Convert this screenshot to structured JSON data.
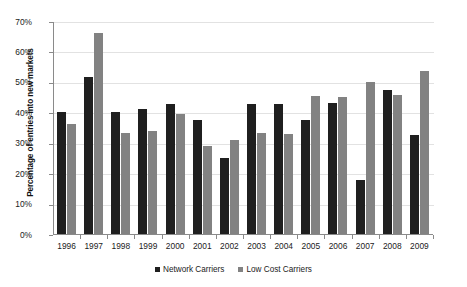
{
  "chart_data": {
    "type": "bar",
    "title": "",
    "xlabel": "",
    "ylabel": "Percentage of entries into new markets",
    "ylim": [
      0,
      70
    ],
    "ytick_labels": [
      "70%",
      "60%",
      "50%",
      "40%",
      "30%",
      "20%",
      "10%",
      "0%"
    ],
    "ytick_values": [
      70,
      60,
      50,
      40,
      30,
      20,
      10,
      0
    ],
    "grid": true,
    "legend_position": "bottom",
    "categories": [
      "1996",
      "1997",
      "1998",
      "1999",
      "2000",
      "2001",
      "2002",
      "2003",
      "2004",
      "2005",
      "2006",
      "2007",
      "2008",
      "2009"
    ],
    "series": [
      {
        "name": "Network Carriers",
        "color": "#1f1f1f",
        "values": [
          40.2,
          51.7,
          40.2,
          41.0,
          42.7,
          37.6,
          24.9,
          42.7,
          42.7,
          37.6,
          43.1,
          17.9,
          47.3,
          32.4
        ]
      },
      {
        "name": "Low Cost Carriers",
        "color": "#828282",
        "values": [
          36.3,
          65.9,
          33.2,
          33.9,
          39.6,
          28.9,
          30.8,
          33.3,
          32.9,
          45.4,
          44.9,
          49.9,
          45.7,
          53.5
        ]
      }
    ]
  },
  "legend": {
    "items": [
      {
        "label": "Network Carriers",
        "color": "#1f1f1f"
      },
      {
        "label": "Low Cost Carriers",
        "color": "#828282"
      }
    ]
  },
  "colors": {
    "axis": "#8a8a8a",
    "grid": "#e2e2e2",
    "text": "#222222",
    "background": "#ffffff"
  }
}
